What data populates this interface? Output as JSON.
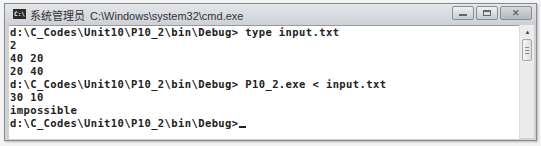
{
  "window": {
    "icon_label": "C:\\",
    "title_prefix": "系统管理员",
    "title_path": "C:\\Windows\\system32\\cmd.exe",
    "controls": {
      "minimize": "minimize",
      "maximize": "maximize",
      "close": "✕"
    }
  },
  "console": {
    "lines": [
      "d:\\C_Codes\\Unit10\\P10_2\\bin\\Debug> type input.txt",
      "2",
      "40 20",
      "20 40",
      "d:\\C_Codes\\Unit10\\P10_2\\bin\\Debug> P10_2.exe < input.txt",
      "30 10",
      "impossible"
    ],
    "prompt": "d:\\C_Codes\\Unit10\\P10_2\\bin\\Debug>"
  },
  "scrollbar": {
    "up_arrow": "▲"
  }
}
